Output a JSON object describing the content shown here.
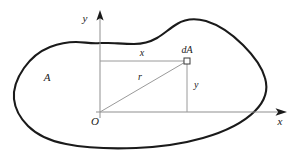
{
  "figure": {
    "background_color": "#ffffff",
    "outline_color": "#1a1a1a",
    "construction_line_color": "#9a9a9a",
    "axis_color": "#8f8f8f",
    "label_color": "#1a1a1a"
  },
  "labels": {
    "y_axis": "y",
    "x_axis": "x",
    "origin": "O",
    "region": "A",
    "element": "dA",
    "horizontal_distance": "x",
    "vertical_distance": "y",
    "radial_distance": "r"
  },
  "geometry": {
    "origin_point": [
      100,
      112
    ],
    "element_point": [
      187,
      61
    ],
    "y_axis_top": [
      100,
      12
    ],
    "x_axis_right": [
      285,
      112
    ],
    "area_outline_path": "M 100,43 C 92,44 84,42 76,42 C 66,42 58,44 50,47 C 40,51 31,58 24,68 C 17,78 13,88 14,99 C 15,109 20,118 28,126 C 37,135 50,141 66,144 C 86,148 110,149 136,148 C 160,147 182,144 203,138 C 224,132 243,123 255,111 C 266,100 268,88 265,78 C 262,67 254,56 243,45 C 232,34 219,25 206,21 C 195,18 185,19 177,24 C 170,28 164,34 157,38 C 150,42 142,44 134,44 C 124,44 114,43 108,43 Z"
  },
  "chart_data": {
    "type": "diagram",
    "points": [
      {
        "name": "O",
        "label": "O",
        "x": 0,
        "y": 0,
        "role": "origin"
      },
      {
        "name": "dA",
        "label": "dA",
        "x": 87,
        "y": 51,
        "role": "element"
      }
    ],
    "segments": [
      {
        "name": "x-distance",
        "label": "x",
        "from": "O-vertical-top",
        "to": "dA",
        "orientation": "horizontal"
      },
      {
        "name": "y-distance",
        "label": "y",
        "from": "dA",
        "to": "O-horizontal-right",
        "orientation": "vertical"
      },
      {
        "name": "r-distance",
        "label": "r",
        "from": "O",
        "to": "dA",
        "orientation": "diagonal"
      }
    ],
    "axes": [
      {
        "name": "x-axis",
        "label": "x",
        "direction": "right",
        "arrow": true
      },
      {
        "name": "y-axis",
        "label": "y",
        "direction": "up",
        "arrow": true
      }
    ]
  }
}
